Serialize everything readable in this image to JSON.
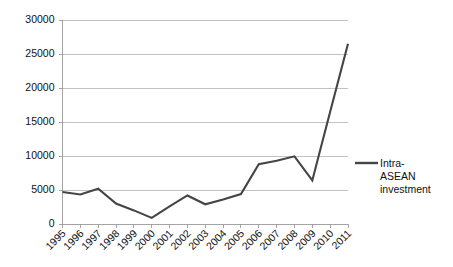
{
  "chart_data": {
    "type": "line",
    "title": "",
    "subtitle": "",
    "xlabel": "",
    "ylabel": "",
    "categories": [
      "1995",
      "1996",
      "1997",
      "1998",
      "1999",
      "2000",
      "2001",
      "2002",
      "2003",
      "2004",
      "2005",
      "2006",
      "2007",
      "2008",
      "2009",
      "2010",
      "2011"
    ],
    "series": [
      {
        "name": "Intra-ASEAN investment",
        "values": [
          4700,
          4350,
          5200,
          3000,
          2000,
          900,
          2600,
          4200,
          2900,
          3600,
          4400,
          8800,
          9300,
          9950,
          6400,
          16500,
          26500
        ]
      }
    ],
    "ytick_labels": [
      "0",
      "5000",
      "10000",
      "15000",
      "20000",
      "25000",
      "30000"
    ],
    "ytick_values": [
      0,
      5000,
      10000,
      15000,
      20000,
      25000,
      30000
    ],
    "ylim": [
      0,
      30000
    ],
    "grid": "horizontal",
    "legend_position": "right",
    "legend_entries": [
      {
        "label_line1": "Intra-",
        "label_line2": "ASEAN",
        "label_line3": "investment",
        "color": "#454545"
      }
    ],
    "colors": {
      "series_line": "#454545",
      "gridline": "#b3b3b3",
      "axis": "#9a9a9a",
      "background": "#ffffff",
      "text": "#111111"
    }
  }
}
